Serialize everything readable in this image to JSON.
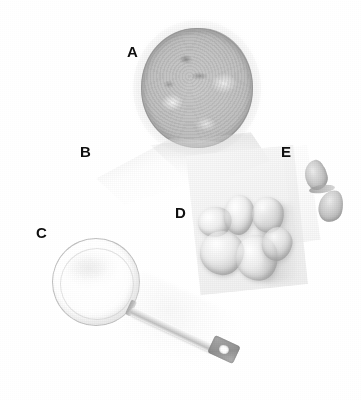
{
  "figure": {
    "type": "labeled-specimen-photograph",
    "background_color": "#ffffff",
    "rendering": "grayscale",
    "width": 362,
    "height": 400,
    "label_color": "#141414"
  },
  "labels": [
    {
      "id": "a",
      "text": "A",
      "x": 127,
      "y": 44,
      "target": "large-round-mottled-specimen"
    },
    {
      "id": "b",
      "text": "B",
      "x": 80,
      "y": 144,
      "target": "faint-pale-sheet"
    },
    {
      "id": "c",
      "text": "C",
      "x": 36,
      "y": 225,
      "target": "transparent-sphere"
    },
    {
      "id": "d",
      "text": "D",
      "x": 175,
      "y": 205,
      "target": "nodular-lobulated-mass"
    },
    {
      "id": "e",
      "text": "E",
      "x": 281,
      "y": 144,
      "target": "bowtie-structure"
    }
  ],
  "objects": {
    "specimen_a": {
      "name": "large-round-mottled-specimen",
      "shape": "circle",
      "tone": "medium-gray mottled with darker rim"
    },
    "specimen_b": {
      "name": "faint-pale-sheet",
      "shape": "diagonal translucent sheet",
      "tone": "very light gray"
    },
    "specimen_c": {
      "name": "transparent-sphere",
      "shape": "thin-outlined sphere",
      "tone": "near white with faint outline"
    },
    "specimen_d": {
      "name": "nodular-lobulated-mass",
      "shape": "cluster of rounded lobes",
      "tone": "light gray with highlights and shadow"
    },
    "specimen_e": {
      "name": "bowtie-structure",
      "shape": "two lobes joined at narrow waist",
      "tone": "medium gray"
    },
    "instrument": {
      "name": "probe-instrument",
      "shape": "straight shaft with collar and perforated end plate",
      "tone": "pale gray metallic"
    }
  }
}
